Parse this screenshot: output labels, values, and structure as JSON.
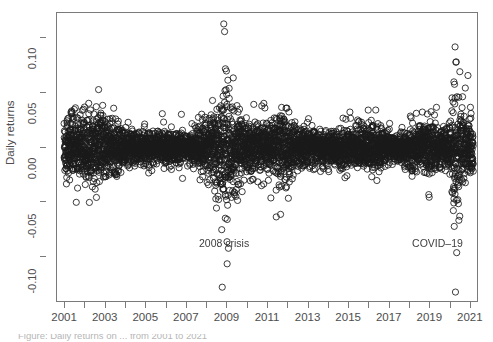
{
  "figure": {
    "background_color": "#ffffff",
    "frame_color": "#7a7a7a",
    "point_color": "#1a1a1a",
    "text_color": "#4d4d4d"
  },
  "axes": {
    "y_title": "Daily returns",
    "x_title": ""
  },
  "annotations": [
    {
      "name": "annotation-2008-crisis",
      "text": "2008 crisis",
      "x_year": 2007.6,
      "y_value": -0.088
    },
    {
      "name": "annotation-covid-19",
      "text": "COVID–19",
      "x_year": 2018.1,
      "y_value": -0.088
    }
  ],
  "caption": {
    "text": "Figure: Daily returns on ... from 2001 to 2021"
  },
  "chart_data": {
    "type": "scatter",
    "title": "",
    "xlabel": "",
    "ylabel": "Daily returns",
    "xlim": [
      2000.6,
      2021.4
    ],
    "ylim": [
      -0.142,
      0.123
    ],
    "grid": false,
    "legend": null,
    "x_ticks_all": [
      2001,
      2002,
      2003,
      2004,
      2005,
      2006,
      2007,
      2008,
      2009,
      2010,
      2011,
      2012,
      2013,
      2014,
      2015,
      2016,
      2017,
      2018,
      2019,
      2020,
      2021
    ],
    "x_ticklabels": [
      "2001",
      "",
      "2003",
      "",
      "2005",
      "",
      "2007",
      "",
      "2009",
      "",
      "2011",
      "",
      "2013",
      "",
      "2015",
      "",
      "2017",
      "",
      "2019",
      "",
      "2021"
    ],
    "y_ticks": [
      0.1,
      0.05,
      0.0,
      -0.05,
      -0.1
    ],
    "y_ticklabels": [
      "0.10",
      "0.05",
      "0.00",
      "-0.05",
      "-0.10"
    ],
    "marker": "open-circle",
    "marker_size_px": 3.1,
    "n_points": 5100,
    "volatility_profile": [
      {
        "year": 2001.0,
        "sigma": 0.0135
      },
      {
        "year": 2001.5,
        "sigma": 0.014
      },
      {
        "year": 2002.0,
        "sigma": 0.014
      },
      {
        "year": 2002.6,
        "sigma": 0.015
      },
      {
        "year": 2003.2,
        "sigma": 0.0125
      },
      {
        "year": 2003.8,
        "sigma": 0.009
      },
      {
        "year": 2004.5,
        "sigma": 0.0072
      },
      {
        "year": 2005.5,
        "sigma": 0.0065
      },
      {
        "year": 2006.3,
        "sigma": 0.007
      },
      {
        "year": 2007.0,
        "sigma": 0.0068
      },
      {
        "year": 2007.6,
        "sigma": 0.0095
      },
      {
        "year": 2008.2,
        "sigma": 0.0125
      },
      {
        "year": 2008.7,
        "sigma": 0.025
      },
      {
        "year": 2008.95,
        "sigma": 0.033
      },
      {
        "year": 2009.2,
        "sigma": 0.026
      },
      {
        "year": 2009.6,
        "sigma": 0.015
      },
      {
        "year": 2010.2,
        "sigma": 0.011
      },
      {
        "year": 2010.5,
        "sigma": 0.0125
      },
      {
        "year": 2011.2,
        "sigma": 0.0095
      },
      {
        "year": 2011.6,
        "sigma": 0.0185
      },
      {
        "year": 2011.9,
        "sigma": 0.015
      },
      {
        "year": 2012.4,
        "sigma": 0.0105
      },
      {
        "year": 2013.0,
        "sigma": 0.0085
      },
      {
        "year": 2013.8,
        "sigma": 0.008
      },
      {
        "year": 2014.6,
        "sigma": 0.0085
      },
      {
        "year": 2015.3,
        "sigma": 0.0085
      },
      {
        "year": 2015.7,
        "sigma": 0.0125
      },
      {
        "year": 2016.1,
        "sigma": 0.0115
      },
      {
        "year": 2016.7,
        "sigma": 0.008
      },
      {
        "year": 2017.4,
        "sigma": 0.0055
      },
      {
        "year": 2018.1,
        "sigma": 0.0105
      },
      {
        "year": 2018.6,
        "sigma": 0.0085
      },
      {
        "year": 2018.95,
        "sigma": 0.014
      },
      {
        "year": 2019.4,
        "sigma": 0.009
      },
      {
        "year": 2019.9,
        "sigma": 0.008
      },
      {
        "year": 2020.2,
        "sigma": 0.032
      },
      {
        "year": 2020.45,
        "sigma": 0.023
      },
      {
        "year": 2020.8,
        "sigma": 0.013
      },
      {
        "year": 2021.0,
        "sigma": 0.012
      }
    ],
    "notable_outliers": [
      {
        "year": 2008.82,
        "value": 0.113
      },
      {
        "year": 2008.86,
        "value": 0.106
      },
      {
        "year": 2008.9,
        "value": 0.072
      },
      {
        "year": 2008.95,
        "value": 0.07
      },
      {
        "year": 2009.05,
        "value": -0.092
      },
      {
        "year": 2008.98,
        "value": -0.086
      },
      {
        "year": 2008.72,
        "value": -0.075
      },
      {
        "year": 2020.22,
        "value": 0.092
      },
      {
        "year": 2020.26,
        "value": 0.078
      },
      {
        "year": 2020.3,
        "value": -0.096
      },
      {
        "year": 2020.24,
        "value": -0.132
      },
      {
        "year": 2011.62,
        "value": -0.061
      },
      {
        "year": 2001.55,
        "value": -0.05
      },
      {
        "year": 2002.65,
        "value": 0.053
      },
      {
        "year": 2020.18,
        "value": -0.072
      }
    ]
  }
}
